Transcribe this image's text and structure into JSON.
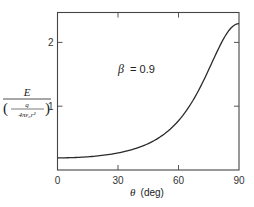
{
  "chart_data": {
    "type": "line",
    "title": "",
    "annotation": "β = 0.9",
    "annotation_parts": {
      "symbol": "β",
      "value": "= 0.9"
    },
    "xlabel": "θ (deg)",
    "xlabel_parts": {
      "symbol": "θ",
      "unit": "(deg)"
    },
    "ylabel": "E / (q / (4πε₀r²))",
    "ylabel_parts": {
      "numerator": "E",
      "inner_numerator": "q",
      "inner_denominator": "4πε₀r²"
    },
    "xlim": [
      0,
      90
    ],
    "ylim": [
      0,
      2.48
    ],
    "x_ticks": [
      0,
      30,
      60,
      90
    ],
    "x_tick_labels": [
      "0",
      "30",
      "60",
      "90"
    ],
    "y_ticks": [
      1,
      2
    ],
    "y_tick_labels": [
      "1",
      "2"
    ],
    "grid": false,
    "legend": null,
    "series": [
      {
        "name": "β = 0.9",
        "x": [
          0,
          10,
          20,
          30,
          40,
          50,
          60,
          65,
          70,
          75,
          80,
          85,
          90
        ],
        "values": [
          0.19,
          0.2,
          0.22,
          0.26,
          0.34,
          0.48,
          0.75,
          0.96,
          1.24,
          1.58,
          1.93,
          2.2,
          2.29
        ]
      }
    ]
  }
}
